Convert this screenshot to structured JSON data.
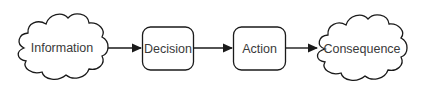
{
  "diagram": {
    "type": "flowchart",
    "direction": "left-to-right",
    "colors": {
      "stroke": "#1a1a1a",
      "fill": "#ffffff",
      "text": "#3a3a3a",
      "background": "#ffffff"
    },
    "nodes": [
      {
        "id": "information",
        "label": "Information",
        "shape": "cloud"
      },
      {
        "id": "decision",
        "label": "Decision",
        "shape": "rounded-rectangle"
      },
      {
        "id": "action",
        "label": "Action",
        "shape": "rounded-rectangle"
      },
      {
        "id": "consequence",
        "label": "Consequence",
        "shape": "cloud"
      }
    ],
    "edges": [
      {
        "from": "information",
        "to": "decision",
        "arrow": "filled-triangle"
      },
      {
        "from": "decision",
        "to": "action",
        "arrow": "filled-triangle"
      },
      {
        "from": "action",
        "to": "consequence",
        "arrow": "filled-triangle"
      }
    ]
  }
}
